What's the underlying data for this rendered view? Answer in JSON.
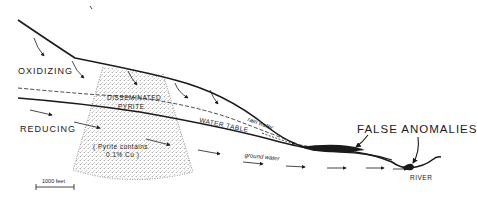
{
  "diagram": {
    "labels": {
      "oxidizing": "OXIDIZING",
      "reducing": "REDUCING",
      "disseminated_line1": "DISSEMINATED",
      "disseminated_line2": "PYRITE",
      "water_table": "WATER TABLE",
      "rain_water": "rain water",
      "pyrite_note_line1": "( Pyrite contains",
      "pyrite_note_line2": "0.1% Cu )",
      "ground_water": "ground water",
      "false_anomalies": "FALSE ANOMALIES",
      "river": "RIVER",
      "scale": "1000 feet"
    },
    "colors": {
      "ink": "#1a1a1a",
      "background": "#ffffff",
      "stipple": "#555555"
    }
  }
}
